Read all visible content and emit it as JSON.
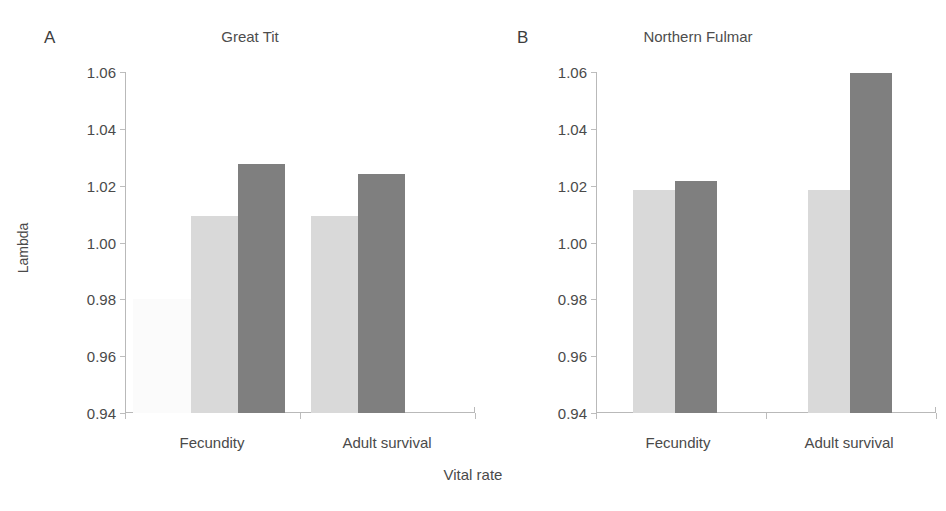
{
  "figure": {
    "xlabel": "Vital rate",
    "ylabel": "Lambda"
  },
  "panels": [
    {
      "letter": "A",
      "title": "Great Tit"
    },
    {
      "letter": "B",
      "title": "Northern Fulmar"
    }
  ],
  "axis": {
    "yticks": [
      "1.06",
      "1.04",
      "1.02",
      "1.00",
      "0.98",
      "0.96",
      "0.94"
    ],
    "ymin": "0.94",
    "ymax": "1.06"
  },
  "colors": {
    "series_1": "#fbfbfb",
    "series_2": "#d9d9d9",
    "series_3": "#7f7f7f",
    "axis": "#b9b9b9",
    "text": "#4a4a4a"
  },
  "chart_data": [
    {
      "type": "bar",
      "title": "Great Tit",
      "panel": "A",
      "xlabel": "Vital rate",
      "ylabel": "Lambda",
      "ylim": [
        0.94,
        1.06
      ],
      "yticks": [
        0.94,
        0.96,
        0.98,
        1.0,
        1.02,
        1.04,
        1.06
      ],
      "grid": false,
      "legend": "none",
      "categories": [
        "Fecundity",
        "Adult survival"
      ],
      "series": [
        {
          "name": "Series 1",
          "color": "#fbfbfb",
          "values": [
            0.98,
            null
          ]
        },
        {
          "name": "Series 2",
          "color": "#d9d9d9",
          "values": [
            1.0095,
            1.0095
          ]
        },
        {
          "name": "Series 3",
          "color": "#7f7f7f",
          "values": [
            1.0278,
            1.024
          ]
        }
      ]
    },
    {
      "type": "bar",
      "title": "Northern Fulmar",
      "panel": "B",
      "xlabel": "Vital rate",
      "ylabel": "Lambda",
      "ylim": [
        0.94,
        1.06
      ],
      "yticks": [
        0.94,
        0.96,
        0.98,
        1.0,
        1.02,
        1.04,
        1.06
      ],
      "grid": false,
      "legend": "none",
      "categories": [
        "Fecundity",
        "Adult survival"
      ],
      "series": [
        {
          "name": "Series 1",
          "color": "#fbfbfb",
          "values": [
            null,
            null
          ]
        },
        {
          "name": "Series 2",
          "color": "#d9d9d9",
          "values": [
            1.0185,
            1.0184
          ]
        },
        {
          "name": "Series 3",
          "color": "#7f7f7f",
          "values": [
            1.0216,
            1.0596
          ]
        }
      ]
    }
  ],
  "render": {
    "panel_a": {
      "bars": [
        {
          "name": "bar-fecundity-s1",
          "left": 8,
          "width": 58,
          "value": 0.98,
          "color": "#fbfbfb"
        },
        {
          "name": "bar-fecundity-s2",
          "left": 66,
          "width": 47,
          "value": 1.0095,
          "color": "#d9d9d9"
        },
        {
          "name": "bar-fecundity-s3",
          "left": 113,
          "width": 47,
          "value": 1.0278,
          "color": "#7f7f7f"
        },
        {
          "name": "bar-adultsurvival-s2",
          "left": 186,
          "width": 47,
          "value": 1.0095,
          "color": "#d9d9d9"
        },
        {
          "name": "bar-adultsurvival-s3",
          "left": 233,
          "width": 47,
          "value": 1.024,
          "color": "#7f7f7f"
        }
      ],
      "xticks": [
        0,
        175,
        350
      ],
      "catlabels": [
        {
          "label": "Fecundity",
          "center": 87
        },
        {
          "label": "Adult survival",
          "center": 262
        }
      ]
    },
    "panel_b": {
      "bars": [
        {
          "name": "bar-fecundity-s2",
          "left": 37,
          "width": 42,
          "value": 1.0185,
          "color": "#d9d9d9"
        },
        {
          "name": "bar-fecundity-s3",
          "left": 79,
          "width": 42,
          "value": 1.0216,
          "color": "#7f7f7f"
        },
        {
          "name": "bar-adultsurvival-s2",
          "left": 212,
          "width": 42,
          "value": 1.0184,
          "color": "#d9d9d9"
        },
        {
          "name": "bar-adultsurvival-s3",
          "left": 254,
          "width": 42,
          "value": 1.0596,
          "color": "#7f7f7f"
        }
      ],
      "xticks": [
        0,
        170,
        340
      ],
      "catlabels": [
        {
          "label": "Fecundity",
          "center": 82
        },
        {
          "label": "Adult survival",
          "center": 253
        }
      ]
    }
  }
}
